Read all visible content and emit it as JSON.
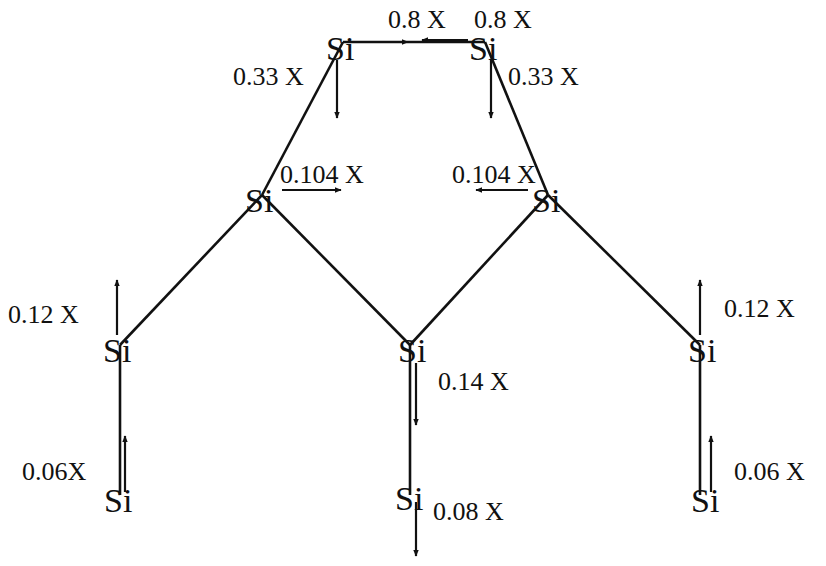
{
  "diagram": {
    "element_symbol": "Si",
    "colors": {
      "ink": "#111111",
      "background": "#ffffff"
    },
    "atoms": [
      {
        "id": "top-left",
        "symbol": "Si"
      },
      {
        "id": "top-right",
        "symbol": "Si"
      },
      {
        "id": "mid-left",
        "symbol": "Si"
      },
      {
        "id": "mid-right",
        "symbol": "Si"
      },
      {
        "id": "lower-left",
        "symbol": "Si"
      },
      {
        "id": "center",
        "symbol": "Si"
      },
      {
        "id": "lower-right",
        "symbol": "Si"
      },
      {
        "id": "bottom-left",
        "symbol": "Si"
      },
      {
        "id": "bottom-center",
        "symbol": "Si"
      },
      {
        "id": "bottom-right",
        "symbol": "Si"
      }
    ],
    "bonds": [
      [
        "top-left",
        "top-right"
      ],
      [
        "top-left",
        "mid-left"
      ],
      [
        "top-right",
        "mid-right"
      ],
      [
        "mid-left",
        "lower-left"
      ],
      [
        "mid-left",
        "center"
      ],
      [
        "mid-right",
        "center"
      ],
      [
        "mid-right",
        "lower-right"
      ],
      [
        "lower-left",
        "bottom-left"
      ],
      [
        "center",
        "bottom-center"
      ],
      [
        "lower-right",
        "bottom-right"
      ]
    ],
    "displacements": [
      {
        "atom": "top-left",
        "direction": "right",
        "label": "0.8 X",
        "magnitude": 0.8
      },
      {
        "atom": "top-right",
        "direction": "left",
        "label": "0.8 X",
        "magnitude": 0.8
      },
      {
        "atom": "top-left",
        "direction": "down",
        "label": "0.33 X",
        "magnitude": 0.33
      },
      {
        "atom": "top-right",
        "direction": "down",
        "label": "0.33 X",
        "magnitude": 0.33
      },
      {
        "atom": "mid-left",
        "direction": "right",
        "label": "0.104 X",
        "magnitude": 0.104
      },
      {
        "atom": "mid-right",
        "direction": "left",
        "label": "0.104 X",
        "magnitude": 0.104
      },
      {
        "atom": "lower-left",
        "direction": "up",
        "label": "0.12 X",
        "magnitude": 0.12
      },
      {
        "atom": "lower-right",
        "direction": "up",
        "label": "0.12 X",
        "magnitude": 0.12
      },
      {
        "atom": "center",
        "direction": "down",
        "label": "0.14 X",
        "magnitude": 0.14
      },
      {
        "atom": "bottom-left",
        "direction": "up",
        "label": "0.06X",
        "magnitude": 0.06
      },
      {
        "atom": "bottom-right",
        "direction": "up",
        "label": "0.06 X",
        "magnitude": 0.06
      },
      {
        "atom": "bottom-center",
        "direction": "down",
        "label": "0.08 X",
        "magnitude": 0.08
      }
    ]
  }
}
